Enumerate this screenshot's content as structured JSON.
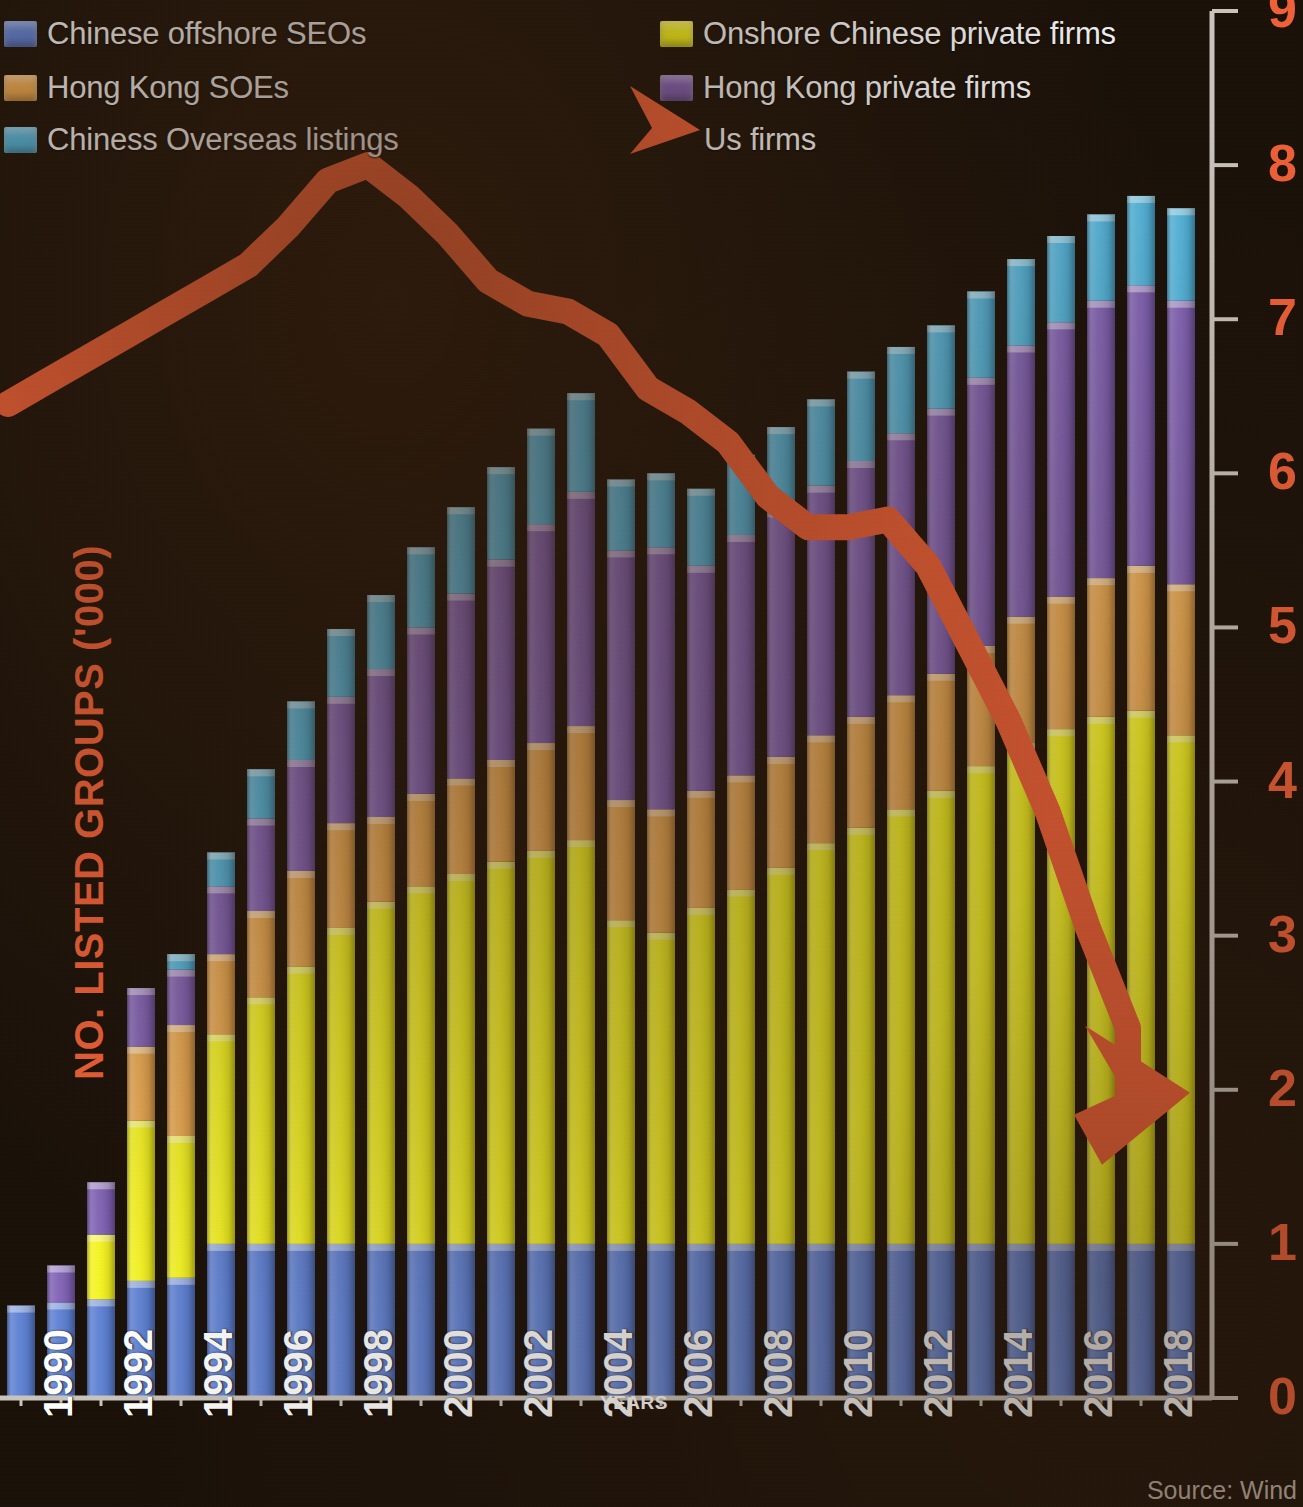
{
  "legend": {
    "items": [
      {
        "label": "Chinese offshore SEOs",
        "color": "#5b7fd4",
        "swatch": true
      },
      {
        "label": "Hong Kong SOEs",
        "color": "#eaa84f",
        "swatch": true
      },
      {
        "label": "Chiness Overseas listings",
        "color": "#4fb4dd",
        "swatch": true
      },
      {
        "label": "Onshore Chinese private firms",
        "color": "#f6f51d",
        "swatch": true
      },
      {
        "label": "Hong Kong private firms",
        "color": "#7f5fb5",
        "swatch": true
      },
      {
        "label": "Us firms",
        "color": "#ef6038",
        "swatch": false
      }
    ]
  },
  "axes": {
    "y_title": "NO. LISTED GROUPS ('000)",
    "y_ticks": [
      "0",
      "1",
      "2",
      "3",
      "4",
      "5",
      "6",
      "7",
      "8",
      "9"
    ],
    "x_title": "YEARS",
    "x_ticks": [
      "1990",
      "1992",
      "1994",
      "1996",
      "1998",
      "2000",
      "2002",
      "2004",
      "2006",
      "2008",
      "2010",
      "2012",
      "2014",
      "2016",
      "2018"
    ]
  },
  "source": "Source: Wind",
  "colors": {
    "background": "#191008",
    "accent": "#ef6038",
    "axis": "#c9c4bc",
    "text": "#f2f2f2"
  },
  "chart_data": {
    "type": "bar",
    "title": "NO. LISTED GROUPS ('000)",
    "xlabel": "YEARS",
    "ylabel": "NO. LISTED GROUPS ('000)",
    "ylim": [
      0,
      9
    ],
    "grid": false,
    "legend_position": "top",
    "stacked": true,
    "categories": [
      "1990",
      "1991",
      "1992",
      "1993",
      "1994",
      "1995",
      "1996",
      "1997",
      "1998",
      "1999",
      "2000",
      "2001",
      "2002",
      "2003",
      "2004",
      "2005",
      "2006",
      "2007",
      "2008",
      "2009",
      "2010",
      "2011",
      "2012",
      "2013",
      "2014",
      "2015",
      "2016",
      "2017",
      "2018",
      "2019"
    ],
    "series": [
      {
        "name": "Chinese offshore SEOs",
        "color": "#5b7fd4",
        "values": [
          0.6,
          0.62,
          0.64,
          0.76,
          0.78,
          1.0,
          1.0,
          1.0,
          1.0,
          1.0,
          1.0,
          1.0,
          1.0,
          1.0,
          1.0,
          1.0,
          1.0,
          1.0,
          1.0,
          1.0,
          1.0,
          1.0,
          1.0,
          1.0,
          1.0,
          1.0,
          1.0,
          1.0,
          1.0,
          1.0
        ]
      },
      {
        "name": "Onshore Chinese private firms",
        "color": "#f6f51d",
        "values": [
          0.0,
          0.0,
          0.42,
          1.04,
          0.92,
          1.36,
          1.6,
          1.8,
          2.05,
          2.22,
          2.32,
          2.4,
          2.48,
          2.55,
          2.62,
          2.1,
          2.02,
          2.18,
          2.3,
          2.44,
          2.6,
          2.7,
          2.82,
          2.94,
          3.1,
          3.25,
          3.34,
          3.42,
          3.46,
          3.3
        ]
      },
      {
        "name": "Hong Kong SOEs",
        "color": "#eaa84f",
        "values": [
          0.0,
          0.0,
          0.0,
          0.48,
          0.72,
          0.52,
          0.56,
          0.62,
          0.68,
          0.55,
          0.6,
          0.62,
          0.66,
          0.7,
          0.74,
          0.78,
          0.8,
          0.76,
          0.74,
          0.72,
          0.7,
          0.72,
          0.74,
          0.76,
          0.78,
          0.82,
          0.86,
          0.9,
          0.94,
          0.98
        ]
      },
      {
        "name": "Hong Kong private firms",
        "color": "#7f5fb5",
        "values": [
          0.0,
          0.24,
          0.34,
          0.38,
          0.36,
          0.44,
          0.6,
          0.72,
          0.82,
          0.96,
          1.08,
          1.2,
          1.3,
          1.42,
          1.52,
          1.62,
          1.7,
          1.46,
          1.56,
          1.6,
          1.62,
          1.66,
          1.7,
          1.72,
          1.74,
          1.76,
          1.78,
          1.8,
          1.82,
          1.84
        ]
      },
      {
        "name": "Chiness Overseas listings",
        "color": "#4fb4dd",
        "values": [
          0.0,
          0.0,
          0.0,
          0.0,
          0.1,
          0.22,
          0.32,
          0.38,
          0.44,
          0.48,
          0.52,
          0.56,
          0.6,
          0.62,
          0.64,
          0.46,
          0.48,
          0.5,
          0.52,
          0.54,
          0.56,
          0.58,
          0.56,
          0.54,
          0.56,
          0.56,
          0.56,
          0.56,
          0.58,
          0.6
        ]
      }
    ],
    "overlay_line": {
      "name": "Us firms",
      "color": "#ef6038",
      "unit": "NO. LISTED GROUPS ('000)",
      "x": [
        "1990",
        "1991",
        "1992",
        "1993",
        "1994",
        "1995",
        "1996",
        "1997",
        "1998",
        "1999",
        "2000",
        "2001",
        "2002",
        "2003",
        "2004",
        "2005",
        "2006",
        "2007",
        "2008",
        "2009",
        "2010",
        "2011",
        "2012",
        "2013",
        "2014",
        "2015",
        "2016",
        "2017",
        "2018",
        "2019"
      ],
      "values": [
        6.45,
        6.6,
        6.75,
        6.9,
        7.05,
        7.2,
        7.35,
        7.6,
        7.9,
        8.0,
        7.8,
        7.55,
        7.25,
        7.1,
        7.05,
        6.9,
        6.55,
        6.4,
        6.2,
        5.85,
        5.65,
        5.65,
        5.7,
        5.4,
        4.9,
        4.4,
        3.8,
        3.05,
        2.4,
        2.0
      ],
      "arrow_tip": 2.0,
      "peak_year": "1999",
      "peak_value": 8.0
    }
  }
}
